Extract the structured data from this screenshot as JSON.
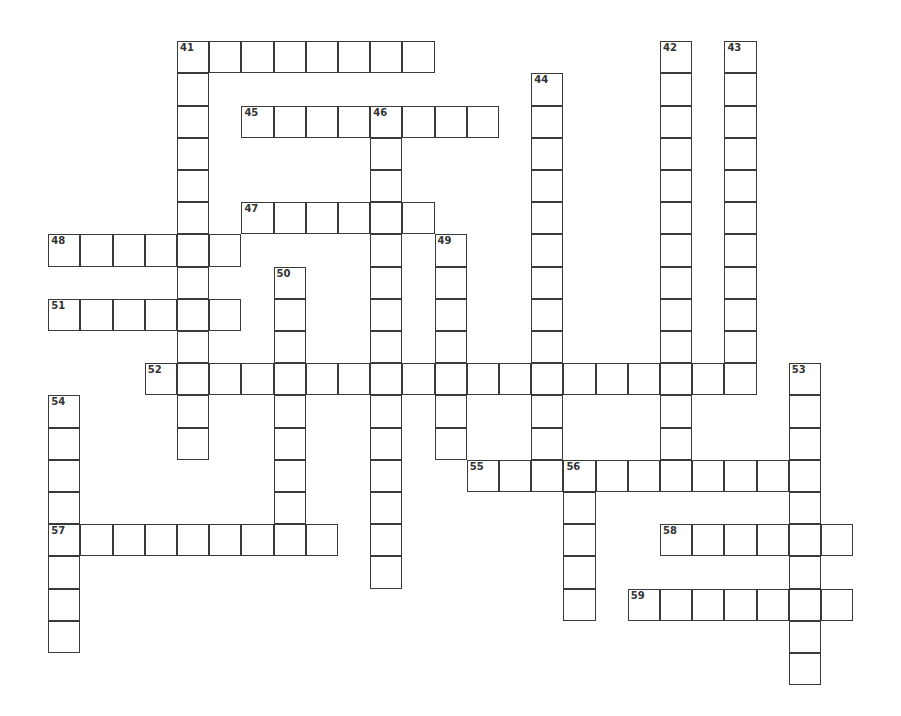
{
  "puzzle": {
    "origin": {
      "x": 49,
      "y": 42
    },
    "cell_size": 32.2,
    "colors": {
      "border": "#3a3a3a",
      "fill": "#ffffff",
      "number": "#333333"
    }
  },
  "entries": [
    {
      "number": "41",
      "direction": "across",
      "row": 0,
      "col": 4,
      "length": 8
    },
    {
      "number": "41",
      "direction": "down",
      "row": 0,
      "col": 4,
      "length": 13
    },
    {
      "number": "42",
      "direction": "down",
      "row": 0,
      "col": 19,
      "length": 13
    },
    {
      "number": "43",
      "direction": "down",
      "row": 0,
      "col": 21,
      "length": 11
    },
    {
      "number": "44",
      "direction": "down",
      "row": 1,
      "col": 15,
      "length": 13
    },
    {
      "number": "45",
      "direction": "across",
      "row": 2,
      "col": 6,
      "length": 8
    },
    {
      "number": "46",
      "direction": "down",
      "row": 2,
      "col": 10,
      "length": 15
    },
    {
      "number": "47",
      "direction": "across",
      "row": 5,
      "col": 6,
      "length": 6
    },
    {
      "number": "48",
      "direction": "across",
      "row": 6,
      "col": 0,
      "length": 6
    },
    {
      "number": "49",
      "direction": "down",
      "row": 6,
      "col": 12,
      "length": 7
    },
    {
      "number": "50",
      "direction": "down",
      "row": 7,
      "col": 7,
      "length": 9
    },
    {
      "number": "51",
      "direction": "across",
      "row": 8,
      "col": 0,
      "length": 6
    },
    {
      "number": "52",
      "direction": "across",
      "row": 10,
      "col": 3,
      "length": 19
    },
    {
      "number": "53",
      "direction": "down",
      "row": 10,
      "col": 23,
      "length": 10
    },
    {
      "number": "54",
      "direction": "down",
      "row": 11,
      "col": 0,
      "length": 8
    },
    {
      "number": "55",
      "direction": "across",
      "row": 13,
      "col": 13,
      "length": 11
    },
    {
      "number": "56",
      "direction": "down",
      "row": 13,
      "col": 16,
      "length": 5
    },
    {
      "number": "57",
      "direction": "across",
      "row": 15,
      "col": 0,
      "length": 9
    },
    {
      "number": "58",
      "direction": "across",
      "row": 15,
      "col": 19,
      "length": 6
    },
    {
      "number": "59",
      "direction": "across",
      "row": 17,
      "col": 18,
      "length": 7
    }
  ]
}
